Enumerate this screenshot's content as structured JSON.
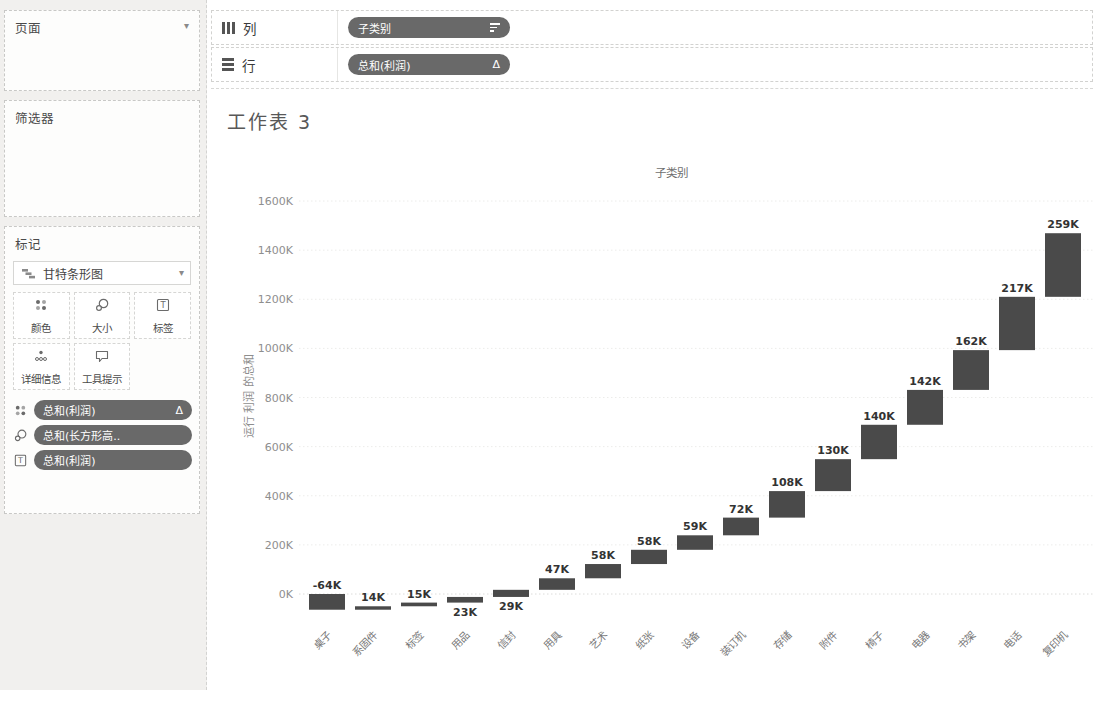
{
  "shelves": {
    "columns": {
      "icon": "columns-icon",
      "label": "列",
      "pill": {
        "label": "子类别",
        "icon": "sort-descending-icon"
      }
    },
    "rows": {
      "icon": "rows-icon",
      "label": "行",
      "pill": {
        "label": "总和(利润)",
        "badge": "Δ"
      }
    }
  },
  "sidebar": {
    "pages": {
      "title": "页面",
      "caret": "▾"
    },
    "filters": {
      "title": "筛选器"
    },
    "marks": {
      "title": "标记",
      "mark_type": "甘特条形图",
      "mark_type_icon": "gantt-bar-icon",
      "caret": "▾",
      "buttons": [
        {
          "label": "颜色",
          "icon": "color-icon"
        },
        {
          "label": "大小",
          "icon": "size-icon"
        },
        {
          "label": "标签",
          "icon": "label-icon"
        },
        {
          "label": "详细信息",
          "icon": "detail-icon"
        },
        {
          "label": "工具提示",
          "icon": "tooltip-icon"
        }
      ],
      "pills": [
        {
          "label": "总和(利润)",
          "icon": "color-icon",
          "badge": "Δ"
        },
        {
          "label": "总和(长方形高..",
          "icon": "size-icon",
          "badge": ""
        },
        {
          "label": "总和(利润)",
          "icon": "label-icon",
          "badge": ""
        }
      ]
    }
  },
  "sheet": {
    "title": "工作表 3"
  },
  "chart_data": {
    "type": "bar",
    "subtype": "waterfall-gantt",
    "title": "工作表 3",
    "column_header": "子类别",
    "xlabel": "子类别",
    "ylabel": "运行 利润 的总和",
    "categories": [
      "桌子",
      "系固件",
      "标签",
      "用品",
      "信封",
      "用具",
      "艺术",
      "纸张",
      "设备",
      "装订机",
      "存储",
      "附件",
      "椅子",
      "电器",
      "书架",
      "电话",
      "复印机"
    ],
    "values_k": [
      -64,
      14,
      15,
      23,
      29,
      47,
      58,
      58,
      59,
      72,
      108,
      130,
      140,
      142,
      162,
      217,
      259
    ],
    "labels": [
      "-64K",
      "14K",
      "15K",
      "23K",
      "29K",
      "47K",
      "58K",
      "58K",
      "59K",
      "72K",
      "108K",
      "130K",
      "140K",
      "142K",
      "162K",
      "217K",
      "259K"
    ],
    "label_position": [
      "above",
      "above",
      "above",
      "below",
      "below",
      "above",
      "above",
      "above",
      "above",
      "above",
      "above",
      "above",
      "above",
      "above",
      "above",
      "above",
      "above"
    ],
    "running_totals_k": [
      -64,
      -50,
      -35,
      -12,
      17,
      64,
      122,
      180,
      239,
      311,
      419,
      549,
      689,
      831,
      993,
      1210,
      1469
    ],
    "yticks": [
      "0K",
      "200K",
      "400K",
      "600K",
      "800K",
      "1000K",
      "1200K",
      "1400K",
      "1600K"
    ],
    "ytick_step_k": 200,
    "ylim_k": [
      -90,
      1700
    ],
    "grid": "horizontal-dotted",
    "legend": "none"
  },
  "colors": {
    "bar": "#4a4a4a",
    "pill_bg": "#696969",
    "pill_text": "#ffffff",
    "sidebar_bg": "#f1f0ee",
    "card_border": "#c8c8c6",
    "axis_text": "#8e8e8e",
    "value_label_text": "#333333",
    "title_text": "#585858",
    "gridline": "#ececea",
    "zeroline": "#dcdcda"
  }
}
